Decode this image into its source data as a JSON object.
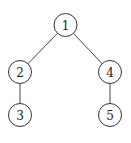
{
  "diagram": {
    "type": "tree",
    "node_radius": 11.5,
    "colors": {
      "stroke": "#333333",
      "edge": "#444444",
      "fill": "#ffffff",
      "text": "#222222"
    },
    "nodes": [
      {
        "id": "n1",
        "label": "1",
        "cx": 65.5,
        "cy": 25
      },
      {
        "id": "n2",
        "label": "2",
        "cx": 20,
        "cy": 72
      },
      {
        "id": "n3",
        "label": "3",
        "cx": 20,
        "cy": 115
      },
      {
        "id": "n4",
        "label": "4",
        "cx": 110,
        "cy": 72
      },
      {
        "id": "n5",
        "label": "5",
        "cx": 110,
        "cy": 115
      }
    ],
    "edges": [
      {
        "from": "n1",
        "to": "n2"
      },
      {
        "from": "n1",
        "to": "n4"
      },
      {
        "from": "n2",
        "to": "n3"
      },
      {
        "from": "n4",
        "to": "n5"
      }
    ]
  }
}
